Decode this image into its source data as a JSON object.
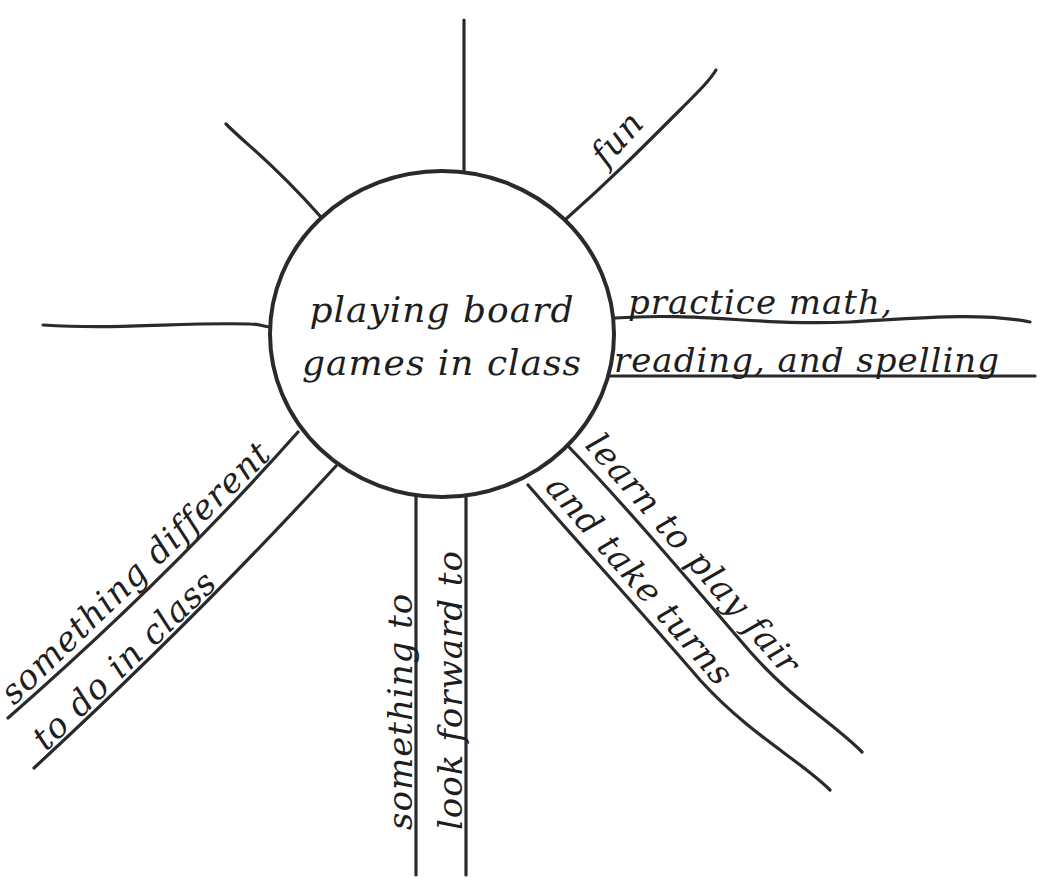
{
  "diagram": {
    "type": "web-organizer",
    "center": {
      "line1": "playing board",
      "line2": "games in class"
    },
    "spokes": [
      {
        "id": "top",
        "lines": []
      },
      {
        "id": "upper-left",
        "lines": []
      },
      {
        "id": "left",
        "lines": []
      },
      {
        "id": "upper-right",
        "lines": [
          "fun"
        ]
      },
      {
        "id": "right",
        "lines": [
          "practice math,",
          "reading, and spelling"
        ]
      },
      {
        "id": "lower-right-1",
        "lines": [
          "learn to play fair"
        ]
      },
      {
        "id": "lower-right-2",
        "lines": [
          "and take turns"
        ]
      },
      {
        "id": "bottom",
        "lines": [
          "something to",
          "look forward to"
        ]
      },
      {
        "id": "lower-left",
        "lines": [
          "something different",
          "to do in class"
        ]
      }
    ]
  },
  "colors": {
    "ink": "#2a2a2a",
    "background": "#ffffff"
  }
}
